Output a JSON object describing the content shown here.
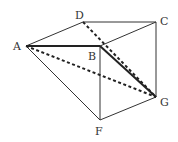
{
  "diagram": {
    "points": {
      "A": {
        "label": "A",
        "x": 26,
        "y": 46
      },
      "B": {
        "label": "B",
        "x": 100,
        "y": 46
      },
      "C": {
        "label": "C",
        "x": 156,
        "y": 22
      },
      "D": {
        "label": "D",
        "x": 83,
        "y": 22
      },
      "F": {
        "label": "F",
        "x": 100,
        "y": 120
      },
      "G": {
        "label": "G",
        "x": 156,
        "y": 97
      }
    },
    "solid_edges": [
      [
        "A",
        "D"
      ],
      [
        "D",
        "C"
      ],
      [
        "C",
        "G"
      ],
      [
        "B",
        "C"
      ],
      [
        "A",
        "F"
      ],
      [
        "B",
        "F"
      ],
      [
        "F",
        "G"
      ]
    ],
    "thick_edges": [
      [
        "A",
        "B"
      ],
      [
        "B",
        "G"
      ]
    ],
    "dashed_edges": [
      [
        "D",
        "G"
      ],
      [
        "A",
        "G"
      ]
    ],
    "colors": {
      "line": "#333333",
      "background": "#ffffff"
    }
  }
}
